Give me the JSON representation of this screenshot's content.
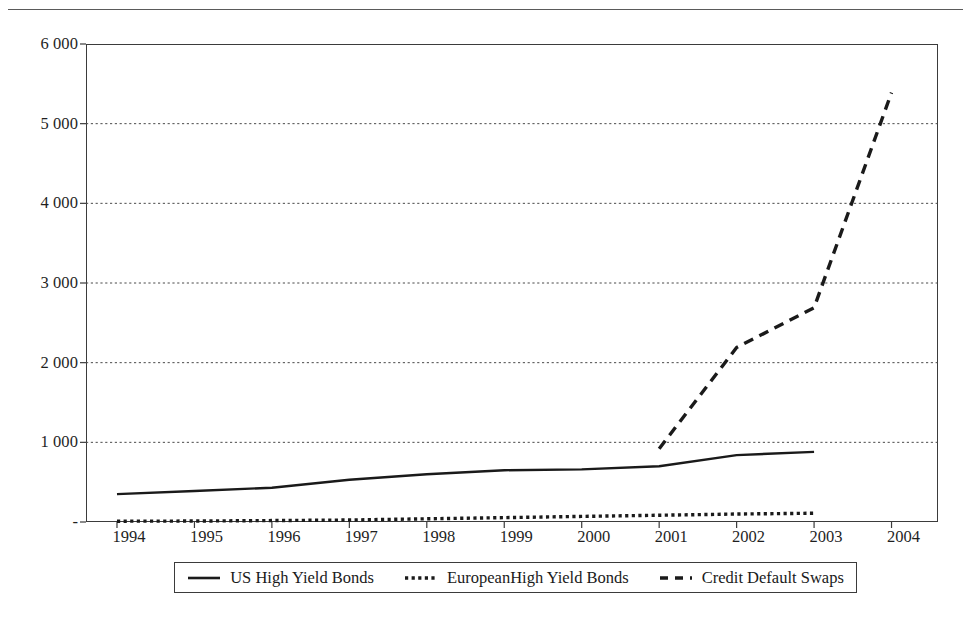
{
  "figure": {
    "kind": "line-chart",
    "background_color": "#ffffff",
    "ink_color": "#1a1a1a",
    "top_rule_color": "#5a5a5a"
  },
  "legend": {
    "position": "bottom-center",
    "border_color": "#3b3b3b",
    "entries": [
      {
        "label": "US High Yield Bonds",
        "style": "solid",
        "marker_name": "solid-line-swatch"
      },
      {
        "label": "EuropeanHigh Yield Bonds",
        "style": "dotted",
        "marker_name": "dotted-line-swatch"
      },
      {
        "label": "Credit Default Swaps",
        "style": "dashed",
        "marker_name": "dashed-line-swatch"
      }
    ]
  },
  "axes": {
    "y_tick_labels": [
      "6 000",
      "5 000",
      "4 000",
      "3 000",
      "2 000",
      "1 000",
      "-"
    ],
    "x_tick_labels": [
      "1994",
      "1995",
      "1996",
      "1997",
      "1998",
      "1999",
      "2000",
      "2001",
      "2002",
      "2003",
      "2004"
    ]
  },
  "chart_data": {
    "type": "line",
    "title": "",
    "subtitle": "",
    "xlabel": "",
    "ylabel": "",
    "xlim": [
      1993.6,
      2004.6
    ],
    "ylim": [
      0,
      6000
    ],
    "yticks": [
      0,
      1000,
      2000,
      3000,
      4000,
      5000,
      6000
    ],
    "ytick_labels": [
      "-",
      "1 000",
      "2 000",
      "3 000",
      "4 000",
      "5 000",
      "6 000"
    ],
    "xticks": [
      1994,
      1995,
      1996,
      1997,
      1998,
      1999,
      2000,
      2001,
      2002,
      2003,
      2004
    ],
    "xtick_labels": [
      "1994",
      "1995",
      "1996",
      "1997",
      "1998",
      "1999",
      "2000",
      "2001",
      "2002",
      "2003",
      "2004"
    ],
    "grid": "horizontal-dotted",
    "legend_position": "below-axes",
    "x": [
      1994,
      1995,
      1996,
      1997,
      1998,
      1999,
      2000,
      2001,
      2002,
      2003,
      2004
    ],
    "series": [
      {
        "name": "US High Yield Bonds",
        "style": "solid",
        "color": "#1a1a1a",
        "x": [
          1994,
          1995,
          1996,
          1997,
          1998,
          1999,
          2000,
          2001,
          2002,
          2003
        ],
        "values": [
          350,
          390,
          430,
          530,
          600,
          650,
          660,
          700,
          840,
          880
        ]
      },
      {
        "name": "EuropeanHigh Yield Bonds",
        "style": "dotted",
        "color": "#1a1a1a",
        "x": [
          1994,
          1995,
          1996,
          1997,
          1998,
          1999,
          2000,
          2001,
          2002,
          2003
        ],
        "values": [
          10,
          12,
          18,
          25,
          40,
          55,
          70,
          85,
          100,
          110
        ]
      },
      {
        "name": "Credit Default Swaps",
        "style": "dashed",
        "color": "#1a1a1a",
        "x": [
          2001,
          2002,
          2003,
          2004
        ],
        "values": [
          920,
          2190,
          2690,
          5390
        ]
      }
    ]
  }
}
